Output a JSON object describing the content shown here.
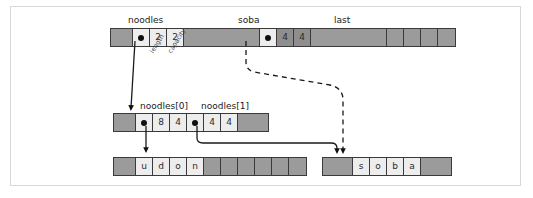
{
  "diagram": {
    "colors": {
      "background": "#ffffff",
      "frame_border": "#d8d8d8",
      "memory_gray": "#9b9b9b",
      "cell_light": "#ededed",
      "stroke": "#2b2b2b",
      "pointer_dot": "#101010"
    }
  },
  "labels": {
    "noodles": "noodles",
    "soba": "soba",
    "last": "last",
    "noodles_0": "noodles[0]",
    "noodles_1": "noodles[1]",
    "length": "length",
    "capacity": "capacity"
  },
  "rows": {
    "top": {
      "name": "top-memory-row",
      "cells": [
        {
          "kind": "gray",
          "text": "",
          "width": "w-pad"
        },
        {
          "kind": "light",
          "text": "",
          "pointer": true
        },
        {
          "kind": "light",
          "text": "2"
        },
        {
          "kind": "light",
          "text": "2"
        },
        {
          "kind": "gray",
          "text": "",
          "width": "w-huge"
        },
        {
          "kind": "light",
          "text": "",
          "pointer": true
        },
        {
          "kind": "dark",
          "text": "4"
        },
        {
          "kind": "dark",
          "text": "4"
        },
        {
          "kind": "gray",
          "text": "",
          "width": "w-huge"
        },
        {
          "kind": "gray",
          "text": ""
        },
        {
          "kind": "gray",
          "text": ""
        },
        {
          "kind": "gray",
          "text": ""
        },
        {
          "kind": "gray",
          "text": ""
        }
      ]
    },
    "middle": {
      "name": "slice-header-array-row",
      "cells": [
        {
          "kind": "gray",
          "text": "",
          "width": "w-pad"
        },
        {
          "kind": "light",
          "text": "",
          "pointer": true
        },
        {
          "kind": "light",
          "text": "8"
        },
        {
          "kind": "light",
          "text": "4"
        },
        {
          "kind": "light",
          "text": "",
          "pointer": true
        },
        {
          "kind": "light",
          "text": "4"
        },
        {
          "kind": "light",
          "text": "4"
        },
        {
          "kind": "gray",
          "text": "",
          "width": "w-wide"
        }
      ]
    },
    "bottom_left": {
      "name": "udon-backing-array-row",
      "cells": [
        {
          "kind": "gray",
          "text": "",
          "width": "w-pad"
        },
        {
          "kind": "light",
          "text": "u"
        },
        {
          "kind": "light",
          "text": "d"
        },
        {
          "kind": "light",
          "text": "o"
        },
        {
          "kind": "light",
          "text": "n"
        },
        {
          "kind": "gray",
          "text": ""
        },
        {
          "kind": "gray",
          "text": ""
        },
        {
          "kind": "gray",
          "text": ""
        },
        {
          "kind": "gray",
          "text": ""
        },
        {
          "kind": "gray",
          "text": ""
        },
        {
          "kind": "gray",
          "text": ""
        }
      ]
    },
    "bottom_right": {
      "name": "soba-backing-array-row",
      "cells": [
        {
          "kind": "gray",
          "text": "",
          "width": "w-wide"
        },
        {
          "kind": "light",
          "text": "s"
        },
        {
          "kind": "light",
          "text": "o"
        },
        {
          "kind": "light",
          "text": "b"
        },
        {
          "kind": "light",
          "text": "a"
        },
        {
          "kind": "gray",
          "text": "",
          "width": "w-wide"
        }
      ]
    }
  },
  "connectors": [
    {
      "name": "noodles-to-header-array",
      "style": "solid"
    },
    {
      "name": "noodles0-to-udon",
      "style": "solid"
    },
    {
      "name": "noodles1-to-soba",
      "style": "solid"
    },
    {
      "name": "soba-to-soba-array",
      "style": "dashed"
    }
  ]
}
